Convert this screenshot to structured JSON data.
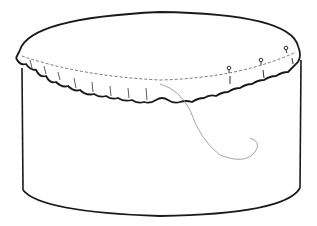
{
  "illustration": {
    "subject": "cylindrical box with ruffled fabric cover pinned around rim and a loose thread",
    "colors": {
      "background": "#ffffff",
      "line": "#1a1a1a",
      "thread": "#9a9a9a"
    },
    "pins_count": 3
  }
}
